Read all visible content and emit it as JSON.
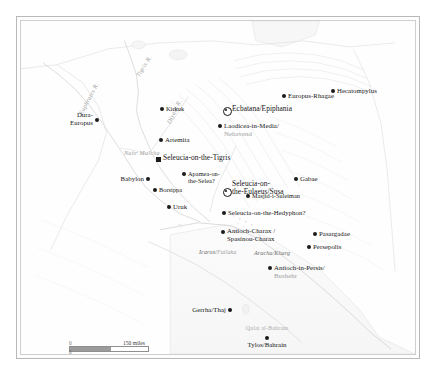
{
  "map": {
    "title": "The Seleucid and Parthian Near East",
    "projection_note": "",
    "background_color": "#fefefe",
    "border_color": "#b9b9b9",
    "label_color": "#161616",
    "modern_label_color": "#9a9a9a",
    "water_label_color": "#8c8c8c"
  },
  "rivers": [
    {
      "name": "Tigris R.",
      "x": 117,
      "y": 52,
      "rotate": -58
    },
    {
      "name": "Euphrates R.",
      "x": 60,
      "y": 90,
      "rotate": -62
    },
    {
      "name": "Diyala R.",
      "x": 148,
      "y": 99,
      "rotate": -64
    },
    {
      "name": "Nahr Malcha",
      "x": 103,
      "y": 129,
      "rotate": 0
    }
  ],
  "places": [
    {
      "id": "dura-europus",
      "name": "Dura-\nEuropus",
      "modern": "",
      "x": 76,
      "y": 99,
      "marker": "dot",
      "align": "r",
      "dx": -4,
      "dy": -9,
      "size": "med"
    },
    {
      "id": "kirkuk",
      "name": "Kirkuk",
      "modern": "",
      "x": 141,
      "y": 88,
      "marker": "dot",
      "align": "l",
      "dx": 4,
      "dy": -4,
      "size": "sm"
    },
    {
      "id": "artemita",
      "name": "Artemita",
      "modern": "",
      "x": 140,
      "y": 119,
      "marker": "dot",
      "align": "l",
      "dx": 4,
      "dy": -4,
      "size": "med"
    },
    {
      "id": "seleucia-tigris",
      "name": "Seleucia-on-the-Tigris",
      "modern": "",
      "x": 137,
      "y": 138,
      "marker": "square",
      "align": "l",
      "dx": 5,
      "dy": -5,
      "size": "big"
    },
    {
      "id": "babylon",
      "name": "Babylon",
      "modern": "",
      "x": 127,
      "y": 158,
      "marker": "dot",
      "align": "r",
      "dx": -4,
      "dy": -4,
      "size": "med"
    },
    {
      "id": "apamea-selea",
      "name": "Apamea-on-\nthe-Selea?",
      "modern": "",
      "x": 163,
      "y": 153,
      "marker": "dot",
      "align": "l",
      "dx": 4,
      "dy": -4,
      "size": "sm"
    },
    {
      "id": "borsippa",
      "name": "Borsippa",
      "modern": "",
      "x": 134,
      "y": 169,
      "marker": "dot",
      "align": "l",
      "dx": 4,
      "dy": -4,
      "size": "sm"
    },
    {
      "id": "uruk",
      "name": "Uruk",
      "modern": "",
      "x": 148,
      "y": 186,
      "marker": "dot",
      "align": "l",
      "dx": 4,
      "dy": -4,
      "size": "med"
    },
    {
      "id": "ecbatana",
      "name": "Ecbatana/Epiphania",
      "modern": "",
      "x": 205,
      "y": 89,
      "marker": "circled",
      "align": "l",
      "dx": 6,
      "dy": -5,
      "size": "big"
    },
    {
      "id": "laodicea-media",
      "name": "Laodicea-in-Media/",
      "modern": "Nehavend",
      "x": 199,
      "y": 105,
      "marker": "dot",
      "align": "l",
      "dx": 4,
      "dy": -4,
      "size": "med"
    },
    {
      "id": "europus-rhagae",
      "name": "Europus-Rhagae",
      "modern": "",
      "x": 263,
      "y": 75,
      "marker": "dot",
      "align": "l",
      "dx": 4,
      "dy": -4,
      "size": "med"
    },
    {
      "id": "hecatompylus",
      "name": "Hecatompylus",
      "modern": "",
      "x": 312,
      "y": 70,
      "marker": "dot",
      "align": "l",
      "dx": 4,
      "dy": -4,
      "size": "med"
    },
    {
      "id": "seleucia-eulaeus",
      "name": "Seleucia-on-\nthe-Eulaeus/Susa",
      "modern": "",
      "x": 205,
      "y": 170,
      "marker": "circled",
      "align": "l",
      "dx": 6,
      "dy": -11,
      "size": "big"
    },
    {
      "id": "gabae",
      "name": "Gabae",
      "modern": "",
      "x": 275,
      "y": 158,
      "marker": "dot",
      "align": "l",
      "dx": 4,
      "dy": -4,
      "size": "med"
    },
    {
      "id": "masjid-suleiman",
      "name": "Masjid-i-Suleiman",
      "modern": "",
      "x": 227,
      "y": 175,
      "marker": "dot",
      "align": "l",
      "dx": 4,
      "dy": -4,
      "size": "sm"
    },
    {
      "id": "seleucia-hedyphon",
      "name": "Seleucia-on-the-Hedyphon?",
      "modern": "",
      "x": 203,
      "y": 192,
      "marker": "dot",
      "align": "l",
      "dx": 4,
      "dy": -4,
      "size": "med"
    },
    {
      "id": "antioch-charax",
      "name": "Antioch-Charax /\nSpasinou-Charax",
      "modern": "",
      "x": 202,
      "y": 211,
      "marker": "dot",
      "align": "l",
      "dx": 4,
      "dy": -5,
      "size": "med"
    },
    {
      "id": "pasargadae",
      "name": "Pasargadae",
      "modern": "",
      "x": 294,
      "y": 213,
      "marker": "dot",
      "align": "l",
      "dx": 4,
      "dy": -4,
      "size": "med"
    },
    {
      "id": "persepolis",
      "name": "Persepolis",
      "modern": "",
      "x": 288,
      "y": 226,
      "marker": "dot",
      "align": "l",
      "dx": 4,
      "dy": -4,
      "size": "med"
    },
    {
      "id": "antioch-persis",
      "name": "Antioch-in-Persis/",
      "modern": "Bushehr",
      "x": 249,
      "y": 247,
      "marker": "dot",
      "align": "l",
      "dx": 4,
      "dy": -4,
      "size": "med"
    },
    {
      "id": "gerrha-thaj",
      "name": "Gerrha/Thaj",
      "modern": "",
      "x": 209,
      "y": 289,
      "marker": "dot",
      "align": "r",
      "dx": -4,
      "dy": -4,
      "size": "med"
    },
    {
      "id": "tylos-bahrain",
      "name": "Tylos/Bahrain",
      "modern": "",
      "x": 246,
      "y": 317,
      "marker": "dot",
      "align": "c",
      "dx": 0,
      "dy": 3,
      "size": "med"
    }
  ],
  "faint_places": [
    {
      "id": "qalat-al-bahrain",
      "name": "Qalat al-Bahrain",
      "x": 246,
      "y": 303,
      "align": "c"
    }
  ],
  "islands": [
    {
      "id": "icarus-failaka",
      "name": "Icarus/",
      "modern": "Failaka",
      "x": 178,
      "y": 227
    },
    {
      "id": "aracha-kharg",
      "name": "Aracha/Kharg",
      "modern": "",
      "x": 233,
      "y": 228
    }
  ],
  "scale_bar": {
    "zero_label": "0",
    "miles_label": "150 miles",
    "km_label": "300 km",
    "miles_fill_ratio": 0.52,
    "km_fill_ratio": 0.38,
    "miles_width": 80,
    "km_width": 100
  }
}
